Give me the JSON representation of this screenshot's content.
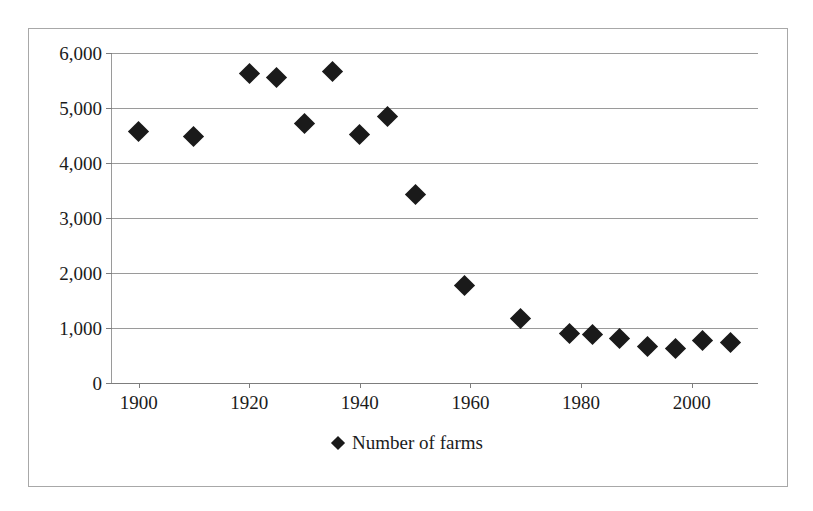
{
  "chart_data": {
    "type": "scatter",
    "title": "",
    "xlabel": "",
    "ylabel": "",
    "xlim": [
      1895,
      2012
    ],
    "ylim": [
      0,
      6000
    ],
    "grid": true,
    "legend_position": "bottom",
    "legend": [
      {
        "label": "Number of farms",
        "marker": "diamond",
        "color": "#1a1a1a"
      }
    ],
    "y_ticks": [
      {
        "value": 0,
        "label": "0"
      },
      {
        "value": 1000,
        "label": "1,000"
      },
      {
        "value": 2000,
        "label": "2,000"
      },
      {
        "value": 3000,
        "label": "3,000"
      },
      {
        "value": 4000,
        "label": "4,000"
      },
      {
        "value": 5000,
        "label": "5,000"
      },
      {
        "value": 6000,
        "label": "6,000"
      }
    ],
    "x_ticks": [
      {
        "value": 1900,
        "label": "1900"
      },
      {
        "value": 1920,
        "label": "1920"
      },
      {
        "value": 1940,
        "label": "1940"
      },
      {
        "value": 1960,
        "label": "1960"
      },
      {
        "value": 1980,
        "label": "1980"
      },
      {
        "value": 2000,
        "label": "2000"
      }
    ],
    "series": [
      {
        "name": "Number of farms",
        "marker": "diamond",
        "color": "#1a1a1a",
        "points": [
          {
            "x": 1900,
            "y": 4565
          },
          {
            "x": 1910,
            "y": 4475
          },
          {
            "x": 1920,
            "y": 5630
          },
          {
            "x": 1925,
            "y": 5550
          },
          {
            "x": 1930,
            "y": 4710
          },
          {
            "x": 1935,
            "y": 5670
          },
          {
            "x": 1940,
            "y": 4510
          },
          {
            "x": 1945,
            "y": 4850
          },
          {
            "x": 1950,
            "y": 3420
          },
          {
            "x": 1959,
            "y": 1780
          },
          {
            "x": 1969,
            "y": 1180
          },
          {
            "x": 1978,
            "y": 900
          },
          {
            "x": 1982,
            "y": 880
          },
          {
            "x": 1987,
            "y": 810
          },
          {
            "x": 1992,
            "y": 670
          },
          {
            "x": 1997,
            "y": 625
          },
          {
            "x": 2002,
            "y": 780
          },
          {
            "x": 2007,
            "y": 730
          }
        ]
      }
    ]
  }
}
